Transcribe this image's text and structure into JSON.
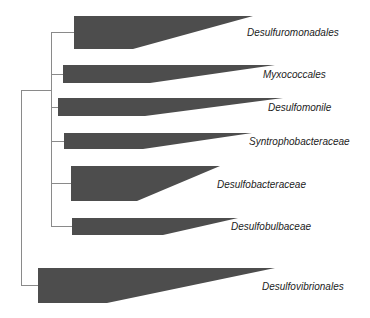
{
  "diagram": {
    "type": "phylogenetic-tree-collapsed-clades",
    "colors": {
      "wedge": "#4d4d4d",
      "branch": "#8a8a8a",
      "label": "#222222",
      "background": "#ffffff"
    },
    "clades": [
      {
        "name": "Desulfuromonadales",
        "label_x": 247,
        "label_y": 27
      },
      {
        "name": "Myxococcales",
        "label_x": 263,
        "label_y": 69
      },
      {
        "name": "Desulfomonile",
        "label_x": 268,
        "label_y": 102
      },
      {
        "name": "Syntrophobacteraceae",
        "label_x": 249,
        "label_y": 136
      },
      {
        "name": "Desulfobacteraceae",
        "label_x": 217,
        "label_y": 179
      },
      {
        "name": "Desulfobulbaceae",
        "label_x": 231,
        "label_y": 221
      },
      {
        "name": "Desulfovibrionales",
        "label_x": 262,
        "label_y": 281
      }
    ]
  }
}
